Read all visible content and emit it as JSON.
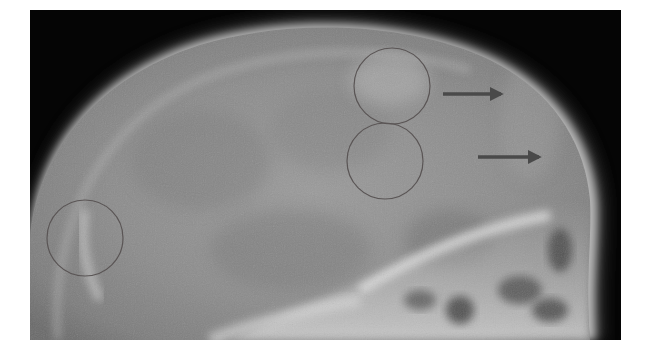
{
  "image": {
    "type": "lateral skull radiograph",
    "frame": {
      "x": 30,
      "y": 10,
      "width": 591,
      "height": 330
    },
    "background_color": "#050505",
    "page_background": "#ffffff"
  },
  "annotations": {
    "stroke_color": "#5a5555",
    "arrow_color": "#4a4a4a",
    "circles": [
      {
        "id": "circle-upper-right",
        "cx": 392,
        "cy": 86,
        "r": 38
      },
      {
        "id": "circle-middle-right",
        "cx": 385,
        "cy": 161,
        "r": 38
      },
      {
        "id": "circle-left-occipital",
        "cx": 85,
        "cy": 238,
        "r": 38
      }
    ],
    "arrows": [
      {
        "id": "arrow-upper",
        "x1": 443,
        "y1": 94,
        "x2": 503,
        "y2": 94
      },
      {
        "id": "arrow-lower",
        "x1": 478,
        "y1": 157,
        "x2": 541,
        "y2": 157
      }
    ]
  }
}
